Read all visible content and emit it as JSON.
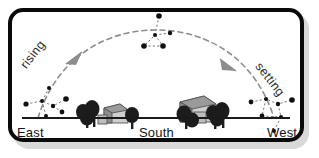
{
  "figure": {
    "frame": {
      "border_color": "#0a0a0a",
      "shadow_color": "#d9d9d9",
      "background": "#ffffff"
    }
  },
  "horizon": {
    "line_label": "horizon-line",
    "color": "#1a1a1a",
    "cardinals": [
      {
        "key": "east",
        "label": "East"
      },
      {
        "key": "south",
        "label": "South"
      },
      {
        "key": "west",
        "label": "West"
      }
    ]
  },
  "motion": {
    "arc_style": "dashed",
    "arc_color": "#8c8c8c",
    "rising_label": "rising",
    "setting_label": "setting",
    "arrows": [
      {
        "key": "rising-arrow",
        "direction": "up-right"
      },
      {
        "key": "setting-arrow",
        "direction": "down-right"
      }
    ]
  },
  "constellations": [
    {
      "key": "constellation-rising",
      "position": "east",
      "star_count": 7,
      "stars": [
        {
          "x": 4,
          "y": 18,
          "size": 2.6
        },
        {
          "x": 20,
          "y": 15,
          "size": 2.0
        },
        {
          "x": 31,
          "y": 20,
          "size": 2.2
        },
        {
          "x": 44,
          "y": 13,
          "size": 2.8
        },
        {
          "x": 40,
          "y": 26,
          "size": 2.4
        },
        {
          "x": 24,
          "y": 30,
          "size": 2.0
        },
        {
          "x": 27,
          "y": 2,
          "size": 2.0
        }
      ]
    },
    {
      "key": "constellation-culminating",
      "position": "south-meridian",
      "star_count": 5,
      "stars": [
        {
          "x": 23,
          "y": 3,
          "size": 2.8
        },
        {
          "x": 19,
          "y": 22,
          "size": 2.0
        },
        {
          "x": 8,
          "y": 33,
          "size": 2.8
        },
        {
          "x": 27,
          "y": 33,
          "size": 2.8
        },
        {
          "x": 34,
          "y": 20,
          "size": 2.2
        }
      ]
    },
    {
      "key": "constellation-setting",
      "position": "west",
      "star_count": 7,
      "stars": [
        {
          "x": 3,
          "y": 16,
          "size": 2.4
        },
        {
          "x": 18,
          "y": 13,
          "size": 2.0
        },
        {
          "x": 30,
          "y": 18,
          "size": 2.2
        },
        {
          "x": 44,
          "y": 14,
          "size": 2.8
        },
        {
          "x": 14,
          "y": 30,
          "size": 2.4
        },
        {
          "x": 33,
          "y": 31,
          "size": 2.0
        },
        {
          "x": 26,
          "y": 45,
          "size": 2.0
        }
      ]
    }
  ],
  "landscape": {
    "buildings": [
      {
        "key": "house-left",
        "label": "small-house",
        "roof_color": "#9a9a9a",
        "wall_color": "#d2d2d2"
      },
      {
        "key": "house-right",
        "label": "large-house",
        "roof_color": "#9a9a9a",
        "wall_color": "#cfcfcf"
      }
    ],
    "trees": [
      {
        "key": "tree-cluster-left",
        "count": 3,
        "color": "#1c1c1c"
      },
      {
        "key": "tree-cluster-right",
        "count": 4,
        "color": "#1c1c1c"
      }
    ]
  }
}
